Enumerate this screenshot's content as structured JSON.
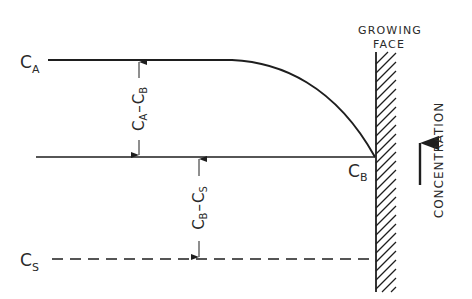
{
  "labels": {
    "ca": "C",
    "ca_sub": "A",
    "cb": "C",
    "cb_sub": "B",
    "cs": "C",
    "cs_sub": "S",
    "growing_face_1": "GROWING",
    "growing_face_2": "FACE",
    "concentration": "CONCENTRATION"
  },
  "dimensions": {
    "upper": {
      "c1": "C",
      "s1": "A",
      "dash": "–",
      "c2": "C",
      "s2": "B"
    },
    "lower": {
      "c1": "C",
      "s1": "B",
      "dash": "–",
      "c2": "C",
      "s2": "S"
    }
  },
  "colors": {
    "ink": "#1e1e1e",
    "background": "#ffffff"
  }
}
